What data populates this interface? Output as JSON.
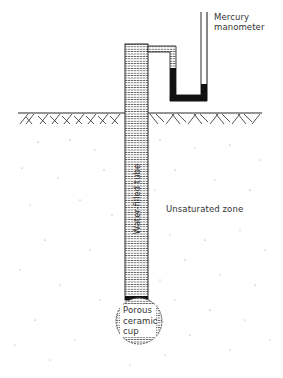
{
  "diagram": {
    "type": "tensiometer-cross-section",
    "labels": {
      "manometer_line1": "Mercury",
      "manometer_line2": "manometer",
      "tube": "Water-filled tube",
      "zone": "Unsaturated zone",
      "cup_line1": "Porous",
      "cup_line2": "ceramic",
      "cup_line3": "cup"
    },
    "components": [
      {
        "id": "mercury-manometer",
        "label": "Mercury manometer"
      },
      {
        "id": "water-filled-tube",
        "label": "Water-filled tube"
      },
      {
        "id": "ground-surface",
        "label": ""
      },
      {
        "id": "unsaturated-zone",
        "label": "Unsaturated zone"
      },
      {
        "id": "porous-ceramic-cup",
        "label": "Porous ceramic cup"
      }
    ],
    "colors": {
      "line": "#2a2a2a",
      "mercury": "#111111",
      "stipple": "#555555",
      "text": "#333333",
      "background": "#ffffff"
    }
  }
}
